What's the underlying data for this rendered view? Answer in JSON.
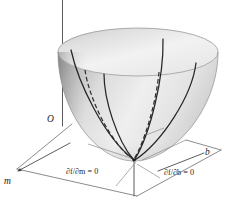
{
  "figure": {
    "kind": "3d-surface-diagram",
    "title": "",
    "background_color": "#ffffff",
    "surface": {
      "name": "paraboloid",
      "description": "upward-opening elliptic paraboloid bowl",
      "fill_light": "#f4f4f4",
      "fill_mid": "#dcdcdc",
      "fill_dark": "#9a9a9a",
      "outline_color": "#8f8f8f"
    },
    "axes": [
      {
        "id": "vertical",
        "label": "",
        "label_visible": false,
        "direction": "up",
        "arrow": false
      },
      {
        "id": "origin",
        "label": "O",
        "label_visible": true,
        "direction": "",
        "arrow": false
      },
      {
        "id": "m",
        "label": "m",
        "label_visible": true,
        "direction": "down-left",
        "arrow": true
      },
      {
        "id": "b",
        "label": "b",
        "label_visible": true,
        "direction": "right",
        "arrow": false
      }
    ],
    "annotations": [
      {
        "id": "partial-m",
        "text": "∂f/∂m = 0",
        "curve_style": "solid",
        "position": "left-of-vertex"
      },
      {
        "id": "partial-b",
        "text": "∂f/∂b = 0",
        "curve_style": "dashed",
        "position": "right-of-vertex"
      }
    ],
    "labels": {
      "origin": "O",
      "axis_m": "m",
      "axis_b": "b",
      "partial_m": "∂f/∂m = 0",
      "partial_b": "∂f/∂b = 0"
    },
    "colors": {
      "ink": "#1c1c1c",
      "trace": "#262626",
      "axis": "#4a4a4a",
      "base": "#6d6d6d",
      "leader": "#8a8a8a"
    },
    "traces": {
      "solid_count": 5,
      "dashed_count": 1,
      "vertex_marker": true
    }
  }
}
